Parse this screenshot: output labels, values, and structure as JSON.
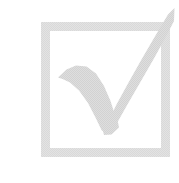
{
  "image": {
    "kind": "icon",
    "subject": "checked checkbox",
    "alt_text": "Light gray checkbox with a check mark",
    "width": 179,
    "height": 183,
    "background_color": "#ffffff",
    "texture": "dithered halftone"
  },
  "checkbox": {
    "label": "checkbox",
    "state": "checked",
    "frame": {
      "label": "checkbox frame",
      "color": "#d9d9d9",
      "stroke_width": 9,
      "left": 41,
      "top": 22,
      "right": 170,
      "bottom": 157
    },
    "checkmark": {
      "label": "check mark",
      "color": "#d2d2d2",
      "start_point": [
        58,
        78
      ],
      "vertex_point": [
        110,
        128
      ],
      "end_point": [
        174,
        8
      ]
    }
  }
}
